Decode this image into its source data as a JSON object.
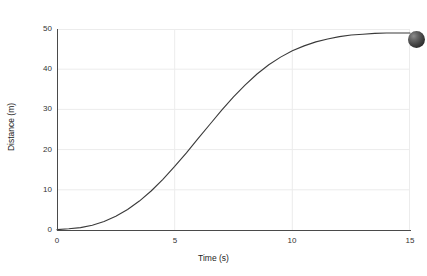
{
  "chart_data": {
    "type": "line",
    "title": "",
    "subtitle": "",
    "xlabel": "Time (s)",
    "ylabel": "Distance (m)",
    "xlim": [
      0,
      15
    ],
    "ylim": [
      0,
      50
    ],
    "xticks": [
      0,
      5,
      10,
      15
    ],
    "yticks": [
      0,
      10,
      20,
      30,
      40,
      50
    ],
    "xtick_labels": [
      "0",
      "5",
      "10",
      "15"
    ],
    "ytick_labels": [
      "0",
      "10",
      "20",
      "30",
      "40",
      "50"
    ],
    "grid": true,
    "grid_color": "#ececec",
    "legend": "none",
    "line_color": "#3a3a3a",
    "line_width": 1.1,
    "series": [
      {
        "name": "Distance",
        "x": [
          0,
          0.5,
          1,
          1.5,
          2,
          2.5,
          3,
          3.5,
          4,
          4.5,
          5,
          5.5,
          6,
          6.5,
          7,
          7.5,
          8,
          8.5,
          9,
          9.5,
          10,
          10.5,
          11,
          11.5,
          12,
          12.5,
          13,
          13.5,
          14,
          14.5,
          15
        ],
        "y": [
          0.1,
          0.3,
          0.6,
          1.2,
          2.1,
          3.4,
          5.1,
          7.2,
          9.7,
          12.6,
          15.8,
          19.2,
          22.8,
          26.3,
          29.8,
          33.1,
          36.1,
          38.8,
          41.1,
          43.0,
          44.6,
          45.8,
          46.8,
          47.5,
          48.1,
          48.5,
          48.7,
          48.9,
          49.0,
          49.0,
          49.0
        ]
      }
    ],
    "annotations": {
      "ball_marker": {
        "name": "ball",
        "description": "dark sphere at right edge",
        "color": "#3a3a3a"
      }
    }
  }
}
